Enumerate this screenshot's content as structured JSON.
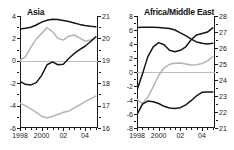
{
  "figure": {
    "panel_count": 2,
    "background": "#ffffff",
    "line_color_dark": "#161616",
    "line_color_light": "#b4b4b4",
    "zero_line_color": "#bdbdbd"
  },
  "chart_data": [
    {
      "type": "line",
      "title": "Asia",
      "xlabel": "",
      "ylabel": "",
      "grid": false,
      "legend": "none",
      "x": [
        1998,
        1998.5,
        1999,
        1999.5,
        2000,
        2000.5,
        2001,
        2001.5,
        2002,
        2002.5,
        2003,
        2003.5,
        2004,
        2004.5,
        2005
      ],
      "xticklabels": [
        "1998",
        "2000",
        "02",
        "04"
      ],
      "xtickvalues": [
        1998,
        2000,
        2002,
        2004
      ],
      "xlim": [
        1998,
        2005.2
      ],
      "left_axis": {
        "ticks": [
          4,
          2,
          0,
          -2,
          -4,
          -6
        ],
        "ylim": [
          -6,
          4
        ]
      },
      "right_axis": {
        "ticks": [
          21,
          20,
          19,
          18,
          17,
          16
        ],
        "ylim": [
          16,
          21
        ]
      },
      "series": [
        {
          "name": "asia-upper-dark",
          "color": "#161616",
          "axis": "left",
          "values": [
            2.85,
            2.9,
            3.0,
            3.2,
            3.45,
            3.62,
            3.7,
            3.68,
            3.6,
            3.5,
            3.38,
            3.25,
            3.15,
            3.08,
            3.05
          ]
        },
        {
          "name": "asia-upper-light",
          "color": "#b4b4b4",
          "axis": "left",
          "values": [
            0.05,
            0.35,
            1.2,
            1.95,
            2.45,
            2.95,
            2.6,
            2.0,
            1.85,
            2.2,
            2.3,
            2.05,
            1.75,
            1.85,
            2.1
          ]
        },
        {
          "name": "asia-mid-dark",
          "color": "#161616",
          "axis": "left",
          "values": [
            -1.85,
            -2.1,
            -2.15,
            -1.95,
            -1.3,
            -0.35,
            -0.1,
            -0.35,
            -0.3,
            0.2,
            0.65,
            1.0,
            1.3,
            1.7,
            2.15
          ]
        },
        {
          "name": "asia-lower-light",
          "color": "#b4b4b4",
          "axis": "left",
          "values": [
            -3.8,
            -4.0,
            -4.3,
            -4.6,
            -4.95,
            -5.1,
            -4.95,
            -4.8,
            -4.6,
            -4.5,
            -4.2,
            -3.95,
            -3.65,
            -3.4,
            -3.15
          ]
        }
      ]
    },
    {
      "type": "line",
      "title": "Africa/Middle East",
      "xlabel": "",
      "ylabel": "",
      "grid": false,
      "legend": "none",
      "x": [
        1998,
        1998.5,
        1999,
        1999.5,
        2000,
        2000.5,
        2001,
        2001.5,
        2002,
        2002.5,
        2003,
        2003.5,
        2004,
        2004.5,
        2005
      ],
      "xticklabels": [
        "1998",
        "2000",
        "02",
        "04"
      ],
      "xtickvalues": [
        1998,
        2000,
        2002,
        2004
      ],
      "xlim": [
        1998,
        2005.2
      ],
      "left_axis": {
        "ticks": [
          8,
          6,
          4,
          2,
          0,
          -2,
          -4,
          -6,
          -8
        ],
        "ylim": [
          -8,
          8
        ]
      },
      "right_axis": {
        "ticks": [
          28,
          27,
          26,
          25,
          24,
          23,
          22,
          21
        ],
        "ylim": [
          21,
          28
        ]
      },
      "series": [
        {
          "name": "afme-upper-dark",
          "color": "#161616",
          "axis": "left",
          "values": [
            6.35,
            6.4,
            6.4,
            6.4,
            6.35,
            6.3,
            6.2,
            6.0,
            5.6,
            5.2,
            4.7,
            4.3,
            4.1,
            4.0,
            4.1
          ]
        },
        {
          "name": "afme-rising-dark",
          "color": "#161616",
          "axis": "left",
          "values": [
            -2.6,
            -0.3,
            2.2,
            3.6,
            4.2,
            3.9,
            3.1,
            2.9,
            3.1,
            3.6,
            4.6,
            5.3,
            5.5,
            5.7,
            6.3
          ]
        },
        {
          "name": "afme-mid-light",
          "color": "#b4b4b4",
          "axis": "left",
          "values": [
            -3.9,
            -4.5,
            -3.6,
            -2.1,
            -0.5,
            0.6,
            1.1,
            1.25,
            1.3,
            1.15,
            1.0,
            1.05,
            1.2,
            1.6,
            2.2
          ]
        },
        {
          "name": "afme-lower-dark",
          "color": "#161616",
          "axis": "left",
          "values": [
            -6.1,
            -4.6,
            -4.15,
            -4.25,
            -4.5,
            -4.9,
            -5.15,
            -5.2,
            -5.1,
            -4.7,
            -4.1,
            -3.4,
            -2.9,
            -2.85,
            -2.85
          ]
        }
      ]
    }
  ]
}
